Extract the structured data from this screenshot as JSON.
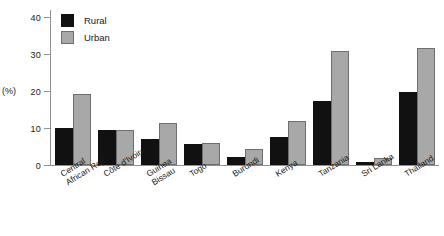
{
  "chart_data": {
    "type": "bar",
    "title": "",
    "xlabel": "",
    "ylabel": "(%)",
    "ylim": [
      0,
      42
    ],
    "yticks": [
      0,
      10,
      20,
      30,
      40
    ],
    "ytick_labels": [
      "0",
      "10",
      "20",
      "30",
      "40"
    ],
    "grid": false,
    "legend_position": "top-left inside plot",
    "categories": [
      "Central African Rep.",
      "Côte d'Ivoire",
      "Guinea Bissau",
      "Togo",
      "Burundi",
      "Kenya",
      "Tanzania",
      "Sri Lanka",
      "Thailand"
    ],
    "category_lines": [
      [
        "Central",
        "African Rep."
      ],
      [
        "Côte d'Ivoire"
      ],
      [
        "Guinea",
        "Bissau"
      ],
      [
        "Togo"
      ],
      [
        "Burundi"
      ],
      [
        "Kenya"
      ],
      [
        "Tanzania"
      ],
      [
        "Sri Lanka"
      ],
      [
        "Thailand"
      ]
    ],
    "series": [
      {
        "name": "Rural",
        "color": "#111111",
        "values": [
          10.0,
          9.4,
          7.1,
          5.7,
          2.3,
          7.5,
          17.4,
          0.8,
          19.8
        ]
      },
      {
        "name": "Urban",
        "color": "#a8a8a8",
        "values": [
          19.3,
          9.5,
          11.4,
          6.0,
          4.3,
          12.0,
          31.0,
          1.9,
          31.7
        ]
      }
    ]
  },
  "legend": {
    "items": [
      {
        "label": "Rural",
        "swatch": "rural"
      },
      {
        "label": "Urban",
        "swatch": "urban"
      }
    ]
  }
}
